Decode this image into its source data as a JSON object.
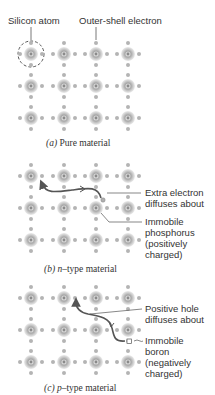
{
  "panel_a": {
    "label_silicon_atom": "Silicon atom",
    "label_outer_shell": "Outer-shell electron",
    "caption_letter": "(a)",
    "caption_text": " Pure material"
  },
  "panel_b": {
    "label_extra_1": "Extra electron",
    "label_extra_2": "diffuses about",
    "label_immobile_1": "Immobile",
    "label_immobile_2": "phosphorus",
    "label_immobile_3": "(positively",
    "label_immobile_4": "charged)",
    "caption_letter": "(b)",
    "caption_n": " n",
    "caption_text": "–type material"
  },
  "panel_c": {
    "label_hole_1": "Positive hole",
    "label_hole_2": "diffuses about",
    "label_immobile_1": "Immobile",
    "label_immobile_2": "boron",
    "label_immobile_3": "(negatively",
    "label_immobile_4": "charged)",
    "caption_letter": "(c)",
    "caption_p": " p",
    "caption_text": "–type material"
  },
  "colors": {
    "atom_outer": "#c8c8c8",
    "atom_core": "#9a9a9a",
    "electron": "#b0b0b0",
    "arrow": "#555555",
    "text": "#333333"
  }
}
